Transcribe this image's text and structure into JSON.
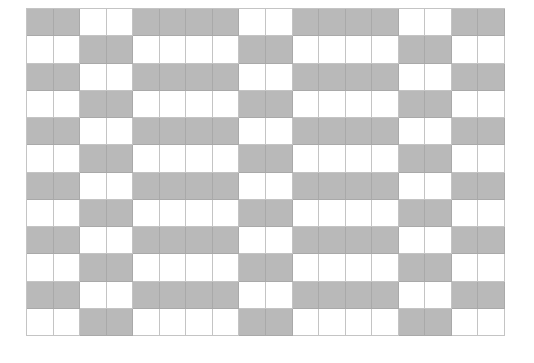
{
  "pattern": {
    "rows": 12,
    "columns": 18,
    "colors": {
      "filled": "#b9b9b9",
      "empty": "#ffffff",
      "grid_line": "#c4c4c4",
      "filled_line": "#a9a9a9"
    },
    "row_patterns": {
      "A": "GGWWGGGGWWGGGGWWGG",
      "B": "WWGGWWWWGGWWWWGGWW"
    },
    "row_sequence": [
      "A",
      "B",
      "A",
      "B",
      "A",
      "B",
      "A",
      "B",
      "A",
      "B",
      "A",
      "B"
    ]
  }
}
